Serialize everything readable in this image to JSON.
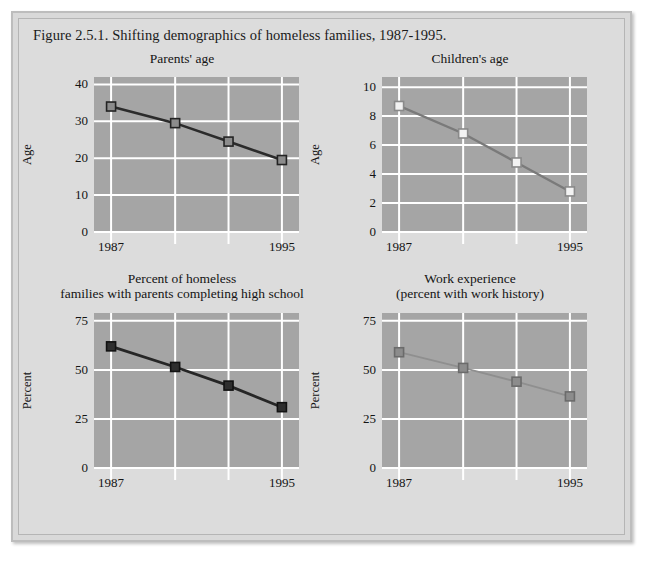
{
  "figure": {
    "title": "Figure 2.5.1. Shifting demographics of homeless families, 1987-1995.",
    "frame_color": "#d9d9d9",
    "plot_bg": "#a5a5a5",
    "grid_color": "#ffffff"
  },
  "chart_data": [
    {
      "id": "parents-age",
      "type": "line",
      "title": "Parents' age",
      "title_lines": [
        "Parents' age"
      ],
      "xlabel": "",
      "ylabel": "Age",
      "x": [
        1987,
        1990,
        1992.5,
        1995
      ],
      "xtick_labels": [
        "1987",
        "1995"
      ],
      "xlim": [
        1986.2,
        1995.8
      ],
      "values": [
        34.0,
        29.5,
        24.5,
        19.5
      ],
      "ylim": [
        0,
        42
      ],
      "yticks": [
        0,
        10,
        20,
        30,
        40
      ],
      "ytick_labels": [
        "0",
        "10",
        "20",
        "30",
        "40"
      ],
      "grid": true,
      "line_color": "#2b2b2b",
      "line_width": 2.6,
      "marker": "square",
      "marker_fill": "#8c8c8c",
      "marker_edge": "#232323",
      "marker_size": 9
    },
    {
      "id": "childrens-age",
      "type": "line",
      "title": "Children's age",
      "title_lines": [
        "Children's age"
      ],
      "xlabel": "",
      "ylabel": "Age",
      "x": [
        1987,
        1990,
        1992.5,
        1995
      ],
      "xtick_labels": [
        "1987",
        "1995"
      ],
      "xlim": [
        1986.2,
        1995.8
      ],
      "values": [
        8.7,
        6.8,
        4.8,
        2.8
      ],
      "ylim": [
        0,
        10.7
      ],
      "yticks": [
        0,
        2,
        4,
        6,
        8,
        10
      ],
      "ytick_labels": [
        "0",
        "2",
        "4",
        "6",
        "8",
        "10"
      ],
      "grid": true,
      "line_color": "#7a7a7a",
      "line_width": 2.4,
      "marker": "square",
      "marker_fill": "#f2f2f2",
      "marker_edge": "#8a8a8a",
      "marker_size": 9
    },
    {
      "id": "high-school-completion",
      "type": "line",
      "title": "Percent of homeless families with parents completing high school",
      "title_lines": [
        "Percent of homeless",
        "families with parents completing high school"
      ],
      "xlabel": "",
      "ylabel": "Percent",
      "x": [
        1987,
        1990,
        1992.5,
        1995
      ],
      "xtick_labels": [
        "1987",
        "1995"
      ],
      "xlim": [
        1986.2,
        1995.8
      ],
      "values": [
        62.0,
        51.5,
        42.0,
        31.0
      ],
      "ylim": [
        0,
        79
      ],
      "yticks": [
        0,
        25,
        50,
        75
      ],
      "ytick_labels": [
        "0",
        "25",
        "50",
        "75"
      ],
      "grid": true,
      "line_color": "#262626",
      "line_width": 2.8,
      "marker": "square",
      "marker_fill": "#2e2e2e",
      "marker_edge": "#111111",
      "marker_size": 9
    },
    {
      "id": "work-experience",
      "type": "line",
      "title": "Work experience (percent with work history)",
      "title_lines": [
        "Work experience",
        "(percent with work history)"
      ],
      "xlabel": "",
      "ylabel": "Percent",
      "x": [
        1987,
        1990,
        1992.5,
        1995
      ],
      "xtick_labels": [
        "1987",
        "1995"
      ],
      "xlim": [
        1986.2,
        1995.8
      ],
      "values": [
        59.0,
        51.0,
        44.0,
        36.5
      ],
      "ylim": [
        0,
        79
      ],
      "yticks": [
        0,
        25,
        50,
        75
      ],
      "ytick_labels": [
        "0",
        "25",
        "50",
        "75"
      ],
      "grid": true,
      "line_color": "#8f8f8f",
      "line_width": 1.8,
      "marker": "square",
      "marker_fill": "#8c8c8c",
      "marker_edge": "#6b6b6b",
      "marker_size": 9
    }
  ]
}
